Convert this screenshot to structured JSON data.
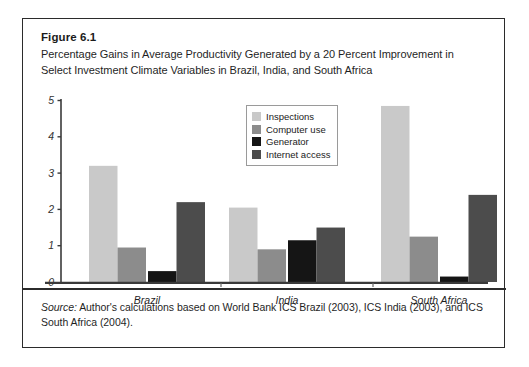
{
  "figure": {
    "number": "Figure 6.1",
    "caption": "Percentage Gains in Average Productivity Generated by a 20 Percent Improvement in Select Investment Climate Variables in Brazil, India, and South Africa",
    "source_lead": "Source:",
    "source_text": " Author's calculations based on World Bank ICS Brazil (2003), ICS India (2003), and ICS South Africa (2004)."
  },
  "legend": {
    "items": [
      {
        "label": "Inspections",
        "color": "#c9c9c9"
      },
      {
        "label": "Computer use",
        "color": "#8c8c8c"
      },
      {
        "label": "Generator",
        "color": "#151515"
      },
      {
        "label": "Internet access",
        "color": "#4c4c4c"
      }
    ]
  },
  "axis": {
    "y_ticks": [
      "0",
      "1",
      "2",
      "3",
      "4",
      "5"
    ]
  },
  "chart_data": {
    "type": "bar",
    "title": "Percentage Gains in Average Productivity Generated by a 20 Percent Improvement in Select Investment Climate Variables in Brazil, India, and South Africa",
    "xlabel": "",
    "ylabel": "",
    "ylim": [
      0,
      5
    ],
    "yticks": [
      0,
      1,
      2,
      3,
      4,
      5
    ],
    "grid": false,
    "legend_position": "upper center",
    "categories": [
      "Brazil",
      "India",
      "South Africa"
    ],
    "series": [
      {
        "name": "Inspections",
        "color": "#c9c9c9",
        "values": [
          3.2,
          2.05,
          4.85
        ]
      },
      {
        "name": "Computer use",
        "color": "#8c8c8c",
        "values": [
          0.95,
          0.9,
          1.25
        ]
      },
      {
        "name": "Generator",
        "color": "#151515",
        "values": [
          0.3,
          1.15,
          0.15
        ]
      },
      {
        "name": "Internet access",
        "color": "#4c4c4c",
        "values": [
          2.2,
          1.5,
          2.4
        ]
      }
    ]
  }
}
